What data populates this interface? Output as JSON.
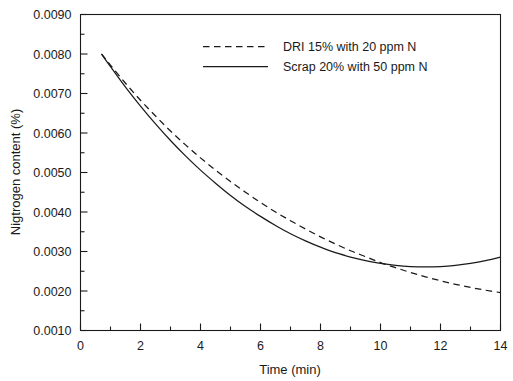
{
  "chart_data": {
    "type": "line",
    "title": "",
    "xlabel": "Time (min)",
    "ylabel": "Nigtrogen content (%)",
    "xlim": [
      0,
      14
    ],
    "ylim": [
      0.001,
      0.009
    ],
    "grid": false,
    "legend_position": "top-center",
    "x_ticks_major": [
      0,
      2,
      4,
      6,
      8,
      10,
      12,
      14
    ],
    "x_ticks_minor": [
      1,
      3,
      5,
      7,
      9,
      11,
      13
    ],
    "x_tick_labels": [
      "0",
      "2",
      "4",
      "6",
      "8",
      "10",
      "12",
      "14"
    ],
    "y_ticks_major": [
      0.001,
      0.002,
      0.003,
      0.004,
      0.005,
      0.006,
      0.007,
      0.008,
      0.009
    ],
    "y_ticks_minor": [
      0.0015,
      0.0025,
      0.0035,
      0.0045,
      0.0055,
      0.0065,
      0.0075,
      0.0085
    ],
    "y_tick_labels": [
      "0.0010",
      "0.0020",
      "0.0030",
      "0.0040",
      "0.0050",
      "0.0060",
      "0.0070",
      "0.0080",
      "0.0090"
    ],
    "series": [
      {
        "name": "DRI 15% with 20 ppm N",
        "style": "dashed",
        "color": "#1a1a1a",
        "x": [
          0.7,
          1.0,
          1.5,
          2.0,
          2.5,
          3.0,
          3.5,
          4.0,
          4.5,
          5.0,
          5.5,
          6.0,
          6.5,
          7.0,
          7.5,
          8.0,
          8.5,
          9.0,
          9.5,
          10.0,
          10.5,
          11.0,
          11.5,
          12.0,
          12.5,
          13.0,
          13.5,
          14.0
        ],
        "y": [
          0.008,
          0.00772,
          0.00726,
          0.00683,
          0.00643,
          0.00605,
          0.0057,
          0.00537,
          0.00506,
          0.00477,
          0.0045,
          0.00424,
          0.004,
          0.00378,
          0.00357,
          0.00337,
          0.00319,
          0.00302,
          0.00287,
          0.00272,
          0.00259,
          0.00247,
          0.00236,
          0.00226,
          0.00217,
          0.00209,
          0.00202,
          0.00196
        ]
      },
      {
        "name": "Scrap 20% with 50 ppm N",
        "style": "solid",
        "color": "#1a1a1a",
        "x": [
          0.7,
          1.0,
          1.5,
          2.0,
          2.5,
          3.0,
          3.5,
          4.0,
          4.5,
          5.0,
          5.5,
          6.0,
          6.5,
          7.0,
          7.5,
          8.0,
          8.5,
          9.0,
          9.5,
          10.0,
          10.5,
          11.0,
          11.5,
          12.0,
          12.5,
          13.0,
          13.5,
          14.0
        ],
        "y": [
          0.008,
          0.00768,
          0.00716,
          0.00668,
          0.00623,
          0.00581,
          0.00542,
          0.00506,
          0.00473,
          0.00442,
          0.00414,
          0.00389,
          0.00366,
          0.00345,
          0.00327,
          0.00311,
          0.00297,
          0.00286,
          0.00277,
          0.0027,
          0.00265,
          0.00262,
          0.00261,
          0.00262,
          0.00265,
          0.0027,
          0.00277,
          0.00286
        ]
      }
    ],
    "legend": [
      {
        "label": "DRI 15% with 20 ppm N",
        "style": "dashed"
      },
      {
        "label": "Scrap 20% with 50 ppm N",
        "style": "solid"
      }
    ]
  }
}
